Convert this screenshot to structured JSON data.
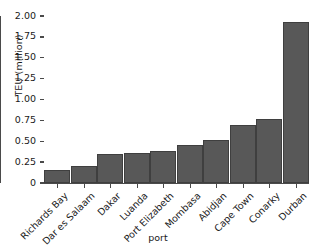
{
  "chart_data": {
    "type": "bar",
    "title": "",
    "xlabel": "port",
    "ylabel": "TEU (million)",
    "categories": [
      "Richards Bay",
      "Dar es Salaam",
      "Dakar",
      "Luanda",
      "Port Elizabeth",
      "Mombasa",
      "Abidjan",
      "Cape Town",
      "Conarky",
      "Durban"
    ],
    "values": [
      0.15,
      0.2,
      0.35,
      0.36,
      0.38,
      0.46,
      0.52,
      0.7,
      0.77,
      1.93
    ],
    "ylim": [
      0,
      2.0
    ],
    "yticks": [
      0,
      0.25,
      0.5,
      0.75,
      1.0,
      1.25,
      1.5,
      1.75,
      2.0
    ],
    "ytick_labels": [
      "0",
      "0.25",
      "0.50",
      "0.75",
      "1.00",
      "1.25",
      "1.50",
      "1.75",
      "2.00"
    ],
    "grid": false,
    "legend": null,
    "bar_color": "#585858",
    "bar_edge_color": "#3f3f3f",
    "axis_color": "#4a4a4a"
  }
}
